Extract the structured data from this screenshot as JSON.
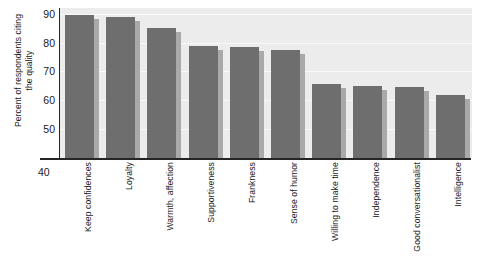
{
  "chart_data": {
    "type": "bar",
    "title": "",
    "xlabel": "",
    "ylabel": "Percent of respondents citing the quality",
    "ylabel_lines": [
      "Percent of respondents citing",
      "the quality"
    ],
    "ylim": [
      40,
      92
    ],
    "yticks": [
      50,
      60,
      70,
      80,
      90
    ],
    "ytick_labels": [
      "50",
      "60",
      "70",
      "80",
      "90"
    ],
    "axis_base_label": "40",
    "grid": true,
    "legend": null,
    "orientation": "vertical",
    "categories": [
      "Keep confidences",
      "Loyalty",
      "Warmth, affection",
      "Supportiveness",
      "Frankness",
      "Sense of humor",
      "Willing to make time",
      "Independence",
      "Good conversationalist",
      "Intelligence"
    ],
    "values": [
      89.5,
      89,
      85,
      79,
      78.5,
      77.5,
      65.5,
      65,
      64.5,
      62
    ],
    "colors": {
      "bar": "#6e6e6e",
      "bar_shadow": "#a9a9a9",
      "plot_background": "#ececec",
      "gridline": "#fafafa",
      "axis": "#252525",
      "text": "#1a1a1a",
      "figure_background": "#ffffff"
    }
  }
}
